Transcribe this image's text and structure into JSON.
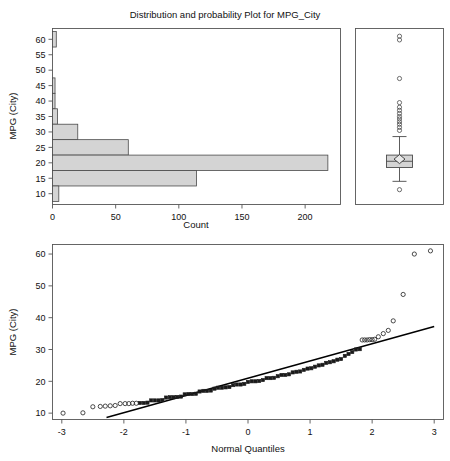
{
  "figure": {
    "title": "Distribution and probability Plot for MPG_City",
    "variable": "MPG_City"
  },
  "chart_data": [
    {
      "type": "bar",
      "name": "histogram",
      "orientation": "horizontal",
      "title": "Distribution and probability Plot for MPG_City",
      "xlabel": "Count",
      "ylabel": "MPG (City)",
      "xlim": [
        0,
        228
      ],
      "ylim": [
        6.5,
        63.5
      ],
      "xticks": [
        0,
        50,
        100,
        150,
        200
      ],
      "yticks": [
        10,
        15,
        20,
        25,
        30,
        35,
        40,
        45,
        50,
        55,
        60
      ],
      "grid": false,
      "bin_width": 5,
      "bins": [
        {
          "lo": 57.5,
          "hi": 62.5,
          "count": 3
        },
        {
          "lo": 52.5,
          "hi": 57.5,
          "count": 0
        },
        {
          "lo": 47.5,
          "hi": 52.5,
          "count": 0
        },
        {
          "lo": 42.5,
          "hi": 47.5,
          "count": 2
        },
        {
          "lo": 37.5,
          "hi": 42.5,
          "count": 2
        },
        {
          "lo": 32.5,
          "hi": 37.5,
          "count": 4
        },
        {
          "lo": 27.5,
          "hi": 32.5,
          "count": 20
        },
        {
          "lo": 22.5,
          "hi": 27.5,
          "count": 60
        },
        {
          "lo": 17.5,
          "hi": 22.5,
          "count": 218
        },
        {
          "lo": 12.5,
          "hi": 17.5,
          "count": 114
        },
        {
          "lo": 7.5,
          "hi": 12.5,
          "count": 5
        }
      ],
      "categories": [
        "7.5-12.5",
        "12.5-17.5",
        "17.5-22.5",
        "22.5-27.5",
        "27.5-32.5",
        "32.5-37.5",
        "37.5-42.5",
        "42.5-47.5",
        "47.5-52.5",
        "52.5-57.5",
        "57.5-62.5"
      ],
      "values": [
        5,
        114,
        218,
        60,
        20,
        4,
        2,
        2,
        0,
        0,
        3
      ]
    },
    {
      "type": "box",
      "name": "box-plot",
      "ylabel": "MPG (City)",
      "ylim": [
        6.5,
        63.5
      ],
      "q1": 18.5,
      "median": 20.5,
      "q3": 22.5,
      "mean": 21.2,
      "whisker_low": 14.0,
      "whisker_high": 28.5,
      "outliers": [
        11.3,
        30.5,
        31.5,
        32.5,
        33.3,
        34.2,
        35.0,
        36.0,
        37.0,
        38.0,
        39.5,
        47.3,
        59.8,
        61.0
      ]
    },
    {
      "type": "scatter",
      "name": "normal-probability-plot",
      "xlabel": "Normal Quantiles",
      "ylabel": "MPG (City)",
      "xlim": [
        -3.15,
        3.15
      ],
      "ylim": [
        8.0,
        63.0
      ],
      "xticks": [
        -3,
        -2,
        -1,
        0,
        1,
        2,
        3
      ],
      "yticks": [
        10,
        20,
        30,
        40,
        50,
        60
      ],
      "grid": false,
      "reference_line": {
        "x": [
          -2.28,
          3.0
        ],
        "y": [
          8.6,
          37.2
        ]
      },
      "points": [
        {
          "x": -2.98,
          "y": 10.0
        },
        {
          "x": -2.66,
          "y": 10.1
        },
        {
          "x": -2.5,
          "y": 12.0
        },
        {
          "x": -2.38,
          "y": 12.1
        },
        {
          "x": -2.3,
          "y": 12.2
        },
        {
          "x": -2.22,
          "y": 12.3
        },
        {
          "x": -2.14,
          "y": 12.4
        },
        {
          "x": -2.06,
          "y": 13.0
        },
        {
          "x": -1.98,
          "y": 13.0
        },
        {
          "x": -1.92,
          "y": 13.0
        },
        {
          "x": -1.86,
          "y": 13.1
        },
        {
          "x": -1.8,
          "y": 13.1
        },
        {
          "x": -1.74,
          "y": 13.2
        },
        {
          "x": -1.68,
          "y": 13.2
        },
        {
          "x": -1.62,
          "y": 13.3
        },
        {
          "x": -1.56,
          "y": 14.0
        },
        {
          "x": -1.5,
          "y": 14.0
        },
        {
          "x": -1.44,
          "y": 14.0
        },
        {
          "x": -1.38,
          "y": 14.1
        },
        {
          "x": -1.32,
          "y": 14.9
        },
        {
          "x": -1.26,
          "y": 15.0
        },
        {
          "x": -1.2,
          "y": 15.0
        },
        {
          "x": -1.14,
          "y": 15.1
        },
        {
          "x": -1.08,
          "y": 15.2
        },
        {
          "x": -1.02,
          "y": 15.9
        },
        {
          "x": -0.96,
          "y": 16.0
        },
        {
          "x": -0.9,
          "y": 16.0
        },
        {
          "x": -0.84,
          "y": 16.1
        },
        {
          "x": -0.78,
          "y": 16.8
        },
        {
          "x": -0.72,
          "y": 17.0
        },
        {
          "x": -0.66,
          "y": 17.0
        },
        {
          "x": -0.6,
          "y": 17.1
        },
        {
          "x": -0.54,
          "y": 17.7
        },
        {
          "x": -0.48,
          "y": 18.0
        },
        {
          "x": -0.42,
          "y": 18.0
        },
        {
          "x": -0.36,
          "y": 18.1
        },
        {
          "x": -0.3,
          "y": 18.2
        },
        {
          "x": -0.24,
          "y": 18.8
        },
        {
          "x": -0.18,
          "y": 19.0
        },
        {
          "x": -0.12,
          "y": 19.0
        },
        {
          "x": -0.06,
          "y": 19.2
        },
        {
          "x": 0.0,
          "y": 19.8
        },
        {
          "x": 0.06,
          "y": 20.0
        },
        {
          "x": 0.12,
          "y": 20.0
        },
        {
          "x": 0.18,
          "y": 20.1
        },
        {
          "x": 0.24,
          "y": 20.4
        },
        {
          "x": 0.3,
          "y": 21.0
        },
        {
          "x": 0.36,
          "y": 21.0
        },
        {
          "x": 0.42,
          "y": 21.1
        },
        {
          "x": 0.48,
          "y": 21.6
        },
        {
          "x": 0.54,
          "y": 22.0
        },
        {
          "x": 0.6,
          "y": 22.0
        },
        {
          "x": 0.66,
          "y": 22.2
        },
        {
          "x": 0.72,
          "y": 22.8
        },
        {
          "x": 0.78,
          "y": 23.0
        },
        {
          "x": 0.84,
          "y": 23.1
        },
        {
          "x": 0.9,
          "y": 23.6
        },
        {
          "x": 0.96,
          "y": 24.0
        },
        {
          "x": 1.02,
          "y": 24.1
        },
        {
          "x": 1.08,
          "y": 24.6
        },
        {
          "x": 1.14,
          "y": 25.0
        },
        {
          "x": 1.2,
          "y": 25.2
        },
        {
          "x": 1.26,
          "y": 25.8
        },
        {
          "x": 1.32,
          "y": 26.0
        },
        {
          "x": 1.38,
          "y": 26.3
        },
        {
          "x": 1.44,
          "y": 26.8
        },
        {
          "x": 1.5,
          "y": 27.0
        },
        {
          "x": 1.56,
          "y": 28.0
        },
        {
          "x": 1.62,
          "y": 28.6
        },
        {
          "x": 1.68,
          "y": 29.2
        },
        {
          "x": 1.74,
          "y": 30.0
        },
        {
          "x": 1.8,
          "y": 30.1
        },
        {
          "x": 1.84,
          "y": 33.0
        },
        {
          "x": 1.88,
          "y": 33.0
        },
        {
          "x": 1.92,
          "y": 33.0
        },
        {
          "x": 1.96,
          "y": 33.1
        },
        {
          "x": 2.0,
          "y": 33.1
        },
        {
          "x": 2.04,
          "y": 33.2
        },
        {
          "x": 2.1,
          "y": 34.0
        },
        {
          "x": 2.18,
          "y": 35.0
        },
        {
          "x": 2.26,
          "y": 36.0
        },
        {
          "x": 2.34,
          "y": 39.0
        },
        {
          "x": 2.5,
          "y": 47.3
        },
        {
          "x": 2.68,
          "y": 60.0
        },
        {
          "x": 2.94,
          "y": 61.0
        }
      ]
    }
  ],
  "top_panel": {
    "title": "Distribution and probability Plot for MPG_City",
    "y_axis_label": "MPG (City)",
    "x_axis_label": "Count",
    "y_tick_labels": [
      "60",
      "55",
      "50",
      "45",
      "40",
      "35",
      "30",
      "25",
      "20",
      "15",
      "10"
    ],
    "x_tick_labels": [
      "0",
      "50",
      "100",
      "150",
      "200"
    ]
  },
  "bottom_panel": {
    "y_axis_label": "MPG (City)",
    "x_axis_label": "Normal Quantiles",
    "y_tick_labels": [
      "60",
      "50",
      "40",
      "30",
      "20",
      "10"
    ],
    "x_tick_labels": [
      "-3",
      "-2",
      "-1",
      "0",
      "1",
      "2",
      "3"
    ]
  },
  "colors": {
    "bar_fill": "#d4d4d4",
    "bar_stroke": "#4a4a4a",
    "frame": "#555555",
    "point": "#2a2a2a",
    "reference_line": "#000000"
  }
}
